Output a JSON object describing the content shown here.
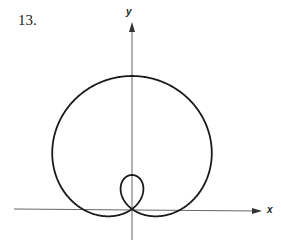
{
  "problem_number": "13.",
  "axes": {
    "x_label": "x",
    "y_label": "y"
  },
  "curve": {
    "type": "polar-limacon-with-inner-loop",
    "equation_form": "r = a + b sin(theta)",
    "a": 49.5,
    "b": 83.5,
    "origin_px": [
      132,
      209
    ],
    "stroke": "#1a1a1a"
  },
  "colors": {
    "axis": "#555555",
    "curve": "#1a1a1a",
    "background": "#ffffff"
  }
}
